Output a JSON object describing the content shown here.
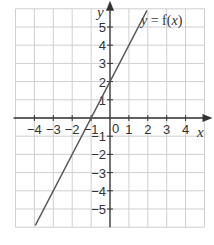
{
  "chart_data": {
    "type": "line",
    "title": "",
    "function_label": "y = f(x)",
    "function_label_parts": {
      "y": "y",
      "eq": " = f(",
      "x": "x",
      "close": ")"
    },
    "xlabel": "x",
    "ylabel": "y",
    "xlim": [
      -5,
      5
    ],
    "ylim": [
      -6,
      6
    ],
    "x_ticks": [
      -4,
      -3,
      -2,
      -1,
      1,
      2,
      3,
      4
    ],
    "y_ticks": [
      -5,
      -4,
      -3,
      -2,
      -1,
      1,
      2,
      3,
      4,
      5
    ],
    "origin_label": "0",
    "grid": true,
    "series": [
      {
        "name": "f(x) = 2x + 2",
        "x": [
          -3.95,
          1.95
        ],
        "y": [
          -5.9,
          5.9
        ]
      }
    ],
    "colors": {
      "grid": "#cfcfcf",
      "axis": "#333333",
      "line": "#555555"
    }
  }
}
